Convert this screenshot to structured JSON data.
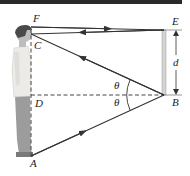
{
  "diagram": {
    "type": "mirror-reflection-ray-diagram",
    "labels": {
      "F": "F",
      "C": "C",
      "D": "D",
      "A": "A",
      "E": "E",
      "B": "B",
      "d": "d",
      "theta_top": "θ",
      "theta_bottom": "θ"
    },
    "colors": {
      "ray": "#333333",
      "dashed": "#444444",
      "mirror": "#d4d4d4",
      "mirror_edge": "#9a9a9a",
      "person_shirt": "#e9e9e6",
      "person_pants": "#9c9c9c",
      "person_hair": "#4a4a4a",
      "person_skin": "#bdbdbd",
      "topbar": "#2a2a2a"
    }
  }
}
